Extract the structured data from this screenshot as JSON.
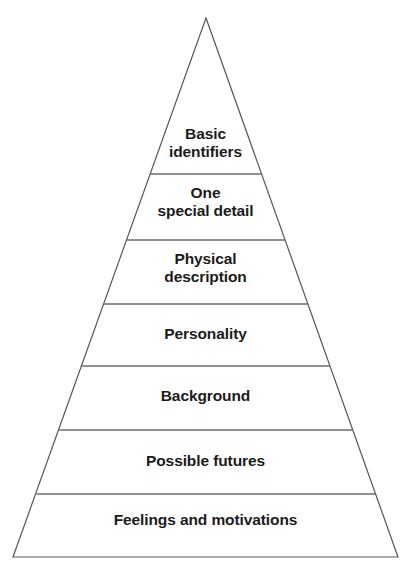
{
  "diagram": {
    "type": "pyramid",
    "name": "character-detail-pyramid",
    "background_color": "#ffffff",
    "outline_color": "#555555",
    "divider_color": "#6b6b6b",
    "text_color": "#1b1b1b",
    "apex": {
      "x": 206,
      "y": 18
    },
    "base": {
      "left_x": 13,
      "right_x": 398,
      "y": 557
    },
    "levels": [
      {
        "index": 1,
        "label": "Basic\nidentifiers",
        "top_y": 18,
        "bottom_y": 174
      },
      {
        "index": 2,
        "label": "One\nspecial detail",
        "top_y": 174,
        "bottom_y": 240
      },
      {
        "index": 3,
        "label": "Physical\ndescription",
        "top_y": 240,
        "bottom_y": 304
      },
      {
        "index": 4,
        "label": "Personality",
        "top_y": 304,
        "bottom_y": 366
      },
      {
        "index": 5,
        "label": "Background",
        "top_y": 366,
        "bottom_y": 430
      },
      {
        "index": 6,
        "label": "Possible futures",
        "top_y": 430,
        "bottom_y": 494
      },
      {
        "index": 7,
        "label": "Feelings and motivations",
        "top_y": 494,
        "bottom_y": 557
      }
    ]
  }
}
